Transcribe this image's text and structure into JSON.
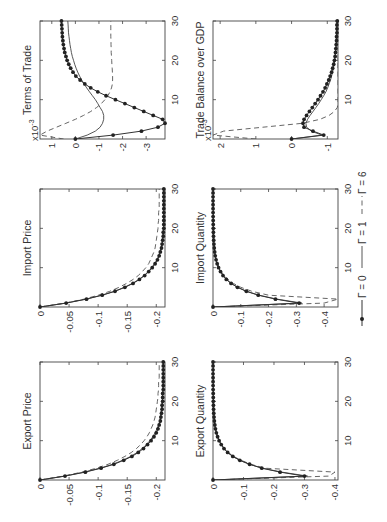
{
  "figure": {
    "rotation_deg": -90,
    "legend": {
      "entries": [
        {
          "label": "Γ = 0",
          "style": "solid-dots"
        },
        {
          "label": "Γ = 1",
          "style": "solid"
        },
        {
          "label": "Γ = 6",
          "style": "dashed"
        }
      ]
    },
    "colors": {
      "line": "#333333",
      "frame": "#444444",
      "background": "#ffffff"
    }
  },
  "chart_data": [
    {
      "type": "line",
      "title": "Export Price",
      "xlabel": "",
      "ylabel": "",
      "xlim": [
        0,
        30
      ],
      "ylim": [
        -0.215,
        0
      ],
      "xticks": [
        10,
        20,
        30
      ],
      "yticks": [
        0,
        -0.05,
        -0.1,
        -0.15,
        -0.2
      ],
      "ytick_labels": [
        "0",
        "-0.05",
        "-0.1",
        "-0.15",
        "-0.2"
      ],
      "x": [
        0,
        1,
        2,
        3,
        4,
        5,
        6,
        7,
        8,
        9,
        10,
        11,
        12,
        13,
        14,
        15,
        16,
        17,
        18,
        19,
        20,
        21,
        22,
        23,
        24,
        25,
        26,
        27,
        28,
        29,
        30
      ],
      "series": [
        {
          "name": "Γ = 0",
          "values": [
            0,
            -0.043,
            -0.078,
            -0.105,
            -0.127,
            -0.144,
            -0.158,
            -0.169,
            -0.178,
            -0.185,
            -0.191,
            -0.196,
            -0.2,
            -0.203,
            -0.205,
            -0.207,
            -0.208,
            -0.209,
            -0.21,
            -0.21,
            -0.211,
            -0.211,
            -0.211,
            -0.212,
            -0.212,
            -0.212,
            -0.212,
            -0.212,
            -0.212,
            -0.212,
            -0.212
          ]
        },
        {
          "name": "Γ = 1",
          "values": [
            0,
            -0.042,
            -0.076,
            -0.103,
            -0.125,
            -0.142,
            -0.156,
            -0.167,
            -0.176,
            -0.183,
            -0.189,
            -0.194,
            -0.198,
            -0.201,
            -0.204,
            -0.206,
            -0.207,
            -0.208,
            -0.209,
            -0.21,
            -0.21,
            -0.211,
            -0.211,
            -0.211,
            -0.211,
            -0.212,
            -0.212,
            -0.212,
            -0.212,
            -0.212,
            -0.212
          ]
        },
        {
          "name": "Γ = 6",
          "values": [
            0,
            -0.04,
            -0.072,
            -0.097,
            -0.117,
            -0.133,
            -0.146,
            -0.157,
            -0.166,
            -0.173,
            -0.179,
            -0.184,
            -0.188,
            -0.191,
            -0.194,
            -0.196,
            -0.198,
            -0.199,
            -0.2,
            -0.201,
            -0.202,
            -0.203,
            -0.203,
            -0.204,
            -0.204,
            -0.204,
            -0.205,
            -0.205,
            -0.205,
            -0.205,
            -0.205
          ]
        }
      ]
    },
    {
      "type": "line",
      "title": "Import Price",
      "xlabel": "",
      "ylabel": "",
      "xlim": [
        0,
        30
      ],
      "ylim": [
        -0.215,
        0
      ],
      "xticks": [
        10,
        20,
        30
      ],
      "yticks": [
        0,
        -0.05,
        -0.1,
        -0.15,
        -0.2
      ],
      "ytick_labels": [
        "0",
        "-0.05",
        "-0.1",
        "-0.15",
        "-0.2"
      ],
      "x": [
        0,
        1,
        2,
        3,
        4,
        5,
        6,
        7,
        8,
        9,
        10,
        11,
        12,
        13,
        14,
        15,
        16,
        17,
        18,
        19,
        20,
        21,
        22,
        23,
        24,
        25,
        26,
        27,
        28,
        29,
        30
      ],
      "series": [
        {
          "name": "Γ = 0",
          "values": [
            0,
            -0.045,
            -0.08,
            -0.107,
            -0.129,
            -0.146,
            -0.16,
            -0.171,
            -0.18,
            -0.187,
            -0.193,
            -0.198,
            -0.202,
            -0.205,
            -0.207,
            -0.209,
            -0.21,
            -0.211,
            -0.212,
            -0.212,
            -0.213,
            -0.213,
            -0.213,
            -0.213,
            -0.213,
            -0.213,
            -0.213,
            -0.213,
            -0.213,
            -0.213,
            -0.213
          ]
        },
        {
          "name": "Γ = 1",
          "values": [
            0,
            -0.044,
            -0.079,
            -0.106,
            -0.128,
            -0.145,
            -0.159,
            -0.17,
            -0.179,
            -0.186,
            -0.192,
            -0.197,
            -0.201,
            -0.204,
            -0.206,
            -0.208,
            -0.21,
            -0.211,
            -0.211,
            -0.212,
            -0.212,
            -0.213,
            -0.213,
            -0.213,
            -0.213,
            -0.213,
            -0.213,
            -0.213,
            -0.213,
            -0.213,
            -0.213
          ]
        },
        {
          "name": "Γ = 6",
          "values": [
            0,
            -0.043,
            -0.076,
            -0.1,
            -0.12,
            -0.136,
            -0.149,
            -0.16,
            -0.169,
            -0.176,
            -0.182,
            -0.187,
            -0.19,
            -0.193,
            -0.196,
            -0.198,
            -0.199,
            -0.2,
            -0.201,
            -0.202,
            -0.203,
            -0.203,
            -0.204,
            -0.204,
            -0.204,
            -0.205,
            -0.205,
            -0.205,
            -0.205,
            -0.205,
            -0.205
          ]
        }
      ]
    },
    {
      "type": "line",
      "title": "Terms of Trade",
      "xlabel": "",
      "ylabel": "",
      "scale_label": "x10^-3",
      "xlim": [
        0,
        30
      ],
      "ylim": [
        -3.8,
        1.5
      ],
      "xticks": [
        10,
        20,
        30
      ],
      "yticks": [
        1,
        0,
        -1,
        -2,
        -3
      ],
      "ytick_labels": [
        "1",
        "0",
        "-1",
        "-2",
        "-3"
      ],
      "x": [
        0,
        1,
        2,
        3,
        4,
        5,
        6,
        7,
        8,
        9,
        10,
        11,
        12,
        13,
        14,
        15,
        16,
        17,
        18,
        19,
        20,
        21,
        22,
        23,
        24,
        25,
        26,
        27,
        28,
        29,
        30
      ],
      "series": [
        {
          "name": "Γ = 0",
          "values": [
            0,
            -1.6,
            -2.8,
            -3.5,
            -3.8,
            -3.7,
            -3.3,
            -2.9,
            -2.5,
            -2.1,
            -1.7,
            -1.3,
            -0.95,
            -0.65,
            -0.4,
            -0.2,
            -0.02,
            0.1,
            0.2,
            0.28,
            0.35,
            0.4,
            0.45,
            0.48,
            0.51,
            0.53,
            0.55,
            0.56,
            0.57,
            0.58,
            0.59
          ]
        },
        {
          "name": "Γ = 1",
          "values": [
            0,
            -0.5,
            -0.85,
            -1.05,
            -1.15,
            -1.2,
            -1.2,
            -1.15,
            -1.05,
            -0.95,
            -0.85,
            -0.72,
            -0.6,
            -0.48,
            -0.37,
            -0.27,
            -0.18,
            -0.1,
            -0.03,
            0.03,
            0.08,
            0.13,
            0.17,
            0.2,
            0.23,
            0.25,
            0.27,
            0.29,
            0.3,
            0.31,
            0.32
          ]
        },
        {
          "name": "Γ = 6",
          "values": [
            0.5,
            1.5,
            1.2,
            0.8,
            0.4,
            0,
            -0.35,
            -0.65,
            -0.9,
            -1.1,
            -1.25,
            -1.38,
            -1.47,
            -1.53,
            -1.57,
            -1.58,
            -1.58,
            -1.57,
            -1.56,
            -1.55,
            -1.54,
            -1.53,
            -1.52,
            -1.52,
            -1.51,
            -1.51,
            -1.5,
            -1.5,
            -1.5,
            -1.5,
            -1.5
          ]
        }
      ]
    },
    {
      "type": "line",
      "title": "Export Quantity",
      "xlabel": "",
      "ylabel": "",
      "xlim": [
        0,
        30
      ],
      "ylim": [
        -0.41,
        0
      ],
      "xticks": [
        10,
        20,
        30
      ],
      "yticks": [
        0,
        -0.1,
        -0.2,
        -0.3,
        -0.4
      ],
      "ytick_labels": [
        "0",
        "-0.1",
        "-0.2",
        "-0.3",
        "-0.4"
      ],
      "x": [
        0,
        1,
        2,
        3,
        4,
        5,
        6,
        7,
        8,
        9,
        10,
        11,
        12,
        13,
        14,
        15,
        16,
        17,
        18,
        19,
        20,
        21,
        22,
        23,
        24,
        25,
        26,
        27,
        28,
        29,
        30
      ],
      "series": [
        {
          "name": "Γ = 0",
          "values": [
            0,
            -0.3,
            -0.22,
            -0.16,
            -0.12,
            -0.088,
            -0.065,
            -0.048,
            -0.036,
            -0.027,
            -0.02,
            -0.015,
            -0.011,
            -0.008,
            -0.006,
            -0.0045,
            -0.0034,
            -0.0025,
            -0.0019,
            -0.0014,
            -0.001,
            -0.0008,
            -0.0006,
            -0.0004,
            -0.0003,
            -0.0002,
            -0.0002,
            -0.0001,
            -0.0001,
            -0.0001,
            0
          ]
        },
        {
          "name": "Γ = 1",
          "values": [
            0,
            -0.31,
            -0.225,
            -0.163,
            -0.12,
            -0.088,
            -0.065,
            -0.048,
            -0.036,
            -0.027,
            -0.02,
            -0.015,
            -0.011,
            -0.008,
            -0.006,
            -0.0045,
            -0.0034,
            -0.0025,
            -0.0019,
            -0.0014,
            -0.001,
            -0.0008,
            -0.0006,
            -0.0004,
            -0.0003,
            -0.0002,
            -0.0002,
            -0.0001,
            -0.0001,
            -0.0001,
            0
          ]
        },
        {
          "name": "Γ = 6",
          "values": [
            0,
            -0.38,
            -0.4,
            -0.17,
            -0.125,
            -0.092,
            -0.068,
            -0.05,
            -0.037,
            -0.028,
            -0.021,
            -0.016,
            -0.012,
            -0.009,
            -0.0066,
            -0.005,
            -0.0037,
            -0.0028,
            -0.002,
            -0.0015,
            -0.0011,
            -0.0008,
            -0.0006,
            -0.0005,
            -0.0003,
            -0.0003,
            -0.0002,
            -0.0001,
            -0.0001,
            -0.0001,
            0
          ]
        }
      ]
    },
    {
      "type": "line",
      "title": "Import Quantity",
      "xlabel": "",
      "ylabel": "",
      "xlim": [
        0,
        30
      ],
      "ylim": [
        -0.45,
        0
      ],
      "xticks": [
        10,
        20,
        30
      ],
      "yticks": [
        0,
        -0.1,
        -0.2,
        -0.3,
        -0.4
      ],
      "ytick_labels": [
        "0",
        "-0.1",
        "-0.2",
        "-0.3",
        "-0.4"
      ],
      "x": [
        0,
        1,
        2,
        3,
        4,
        5,
        6,
        7,
        8,
        9,
        10,
        11,
        12,
        13,
        14,
        15,
        16,
        17,
        18,
        19,
        20,
        21,
        22,
        23,
        24,
        25,
        26,
        27,
        28,
        29,
        30
      ],
      "series": [
        {
          "name": "Γ = 0",
          "values": [
            0,
            -0.31,
            -0.225,
            -0.163,
            -0.12,
            -0.088,
            -0.065,
            -0.048,
            -0.036,
            -0.027,
            -0.02,
            -0.015,
            -0.011,
            -0.008,
            -0.006,
            -0.0045,
            -0.0034,
            -0.0025,
            -0.0019,
            -0.0014,
            -0.001,
            -0.0008,
            -0.0006,
            -0.0004,
            -0.0003,
            -0.0002,
            -0.0002,
            -0.0001,
            -0.0001,
            -0.0001,
            0
          ]
        },
        {
          "name": "Γ = 1",
          "values": [
            0,
            -0.32,
            -0.23,
            -0.166,
            -0.121,
            -0.089,
            -0.066,
            -0.049,
            -0.036,
            -0.027,
            -0.02,
            -0.015,
            -0.011,
            -0.008,
            -0.006,
            -0.0045,
            -0.0034,
            -0.0025,
            -0.0019,
            -0.0014,
            -0.001,
            -0.0008,
            -0.0006,
            -0.0004,
            -0.0003,
            -0.0002,
            -0.0002,
            -0.0001,
            -0.0001,
            -0.0001,
            0
          ]
        },
        {
          "name": "Γ = 6",
          "values": [
            0,
            -0.4,
            -0.45,
            -0.2,
            -0.14,
            -0.1,
            -0.073,
            -0.054,
            -0.04,
            -0.03,
            -0.022,
            -0.017,
            -0.012,
            -0.009,
            -0.007,
            -0.005,
            -0.0038,
            -0.0028,
            -0.0021,
            -0.0016,
            -0.0012,
            -0.0009,
            -0.0007,
            -0.0005,
            -0.0004,
            -0.0003,
            -0.0002,
            -0.0002,
            -0.0001,
            -0.0001,
            0
          ]
        }
      ]
    },
    {
      "type": "line",
      "title": "Trade Balance over GDP",
      "xlabel": "",
      "ylabel": "",
      "scale_label": "x10^-3",
      "xlim": [
        0,
        30
      ],
      "ylim": [
        -1.3,
        2.2
      ],
      "xticks": [
        10,
        20,
        30
      ],
      "yticks": [
        2,
        1,
        0,
        -1
      ],
      "ytick_labels": [
        "2",
        "1",
        "0",
        "-1"
      ],
      "x": [
        0,
        1,
        2,
        3,
        4,
        5,
        6,
        7,
        8,
        9,
        10,
        11,
        12,
        13,
        14,
        15,
        16,
        17,
        18,
        19,
        20,
        21,
        22,
        23,
        24,
        25,
        26,
        27,
        28,
        29,
        30
      ],
      "series": [
        {
          "name": "Γ = 0",
          "values": [
            0,
            -0.9,
            -0.6,
            -0.35,
            -0.32,
            -0.35,
            -0.42,
            -0.5,
            -0.58,
            -0.66,
            -0.74,
            -0.81,
            -0.88,
            -0.94,
            -0.99,
            -1.04,
            -1.08,
            -1.12,
            -1.15,
            -1.18,
            -1.2,
            -1.22,
            -1.23,
            -1.24,
            -1.25,
            -1.26,
            -1.26,
            -1.27,
            -1.27,
            -1.27,
            -1.28
          ]
        },
        {
          "name": "Γ = 1",
          "values": [
            0,
            -0.85,
            -0.55,
            -0.42,
            -0.4,
            -0.45,
            -0.52,
            -0.6,
            -0.68,
            -0.76,
            -0.83,
            -0.9,
            -0.96,
            -1.01,
            -1.05,
            -1.09,
            -1.12,
            -1.15,
            -1.17,
            -1.19,
            -1.21,
            -1.22,
            -1.23,
            -1.24,
            -1.25,
            -1.25,
            -1.26,
            -1.26,
            -1.26,
            -1.27,
            -1.27
          ]
        },
        {
          "name": "Γ = 6",
          "values": [
            1.0,
            2.2,
            1.9,
            0.8,
            -0.3,
            -0.8,
            -1.05,
            -1.2,
            -1.28,
            -1.3,
            -1.3,
            -1.3,
            -1.3,
            -1.3,
            -1.3,
            -1.3,
            -1.3,
            -1.3,
            -1.3,
            -1.3,
            -1.3,
            -1.3,
            -1.3,
            -1.3,
            -1.3,
            -1.3,
            -1.3,
            -1.3,
            -1.3,
            -1.3,
            -1.3
          ]
        }
      ]
    }
  ]
}
